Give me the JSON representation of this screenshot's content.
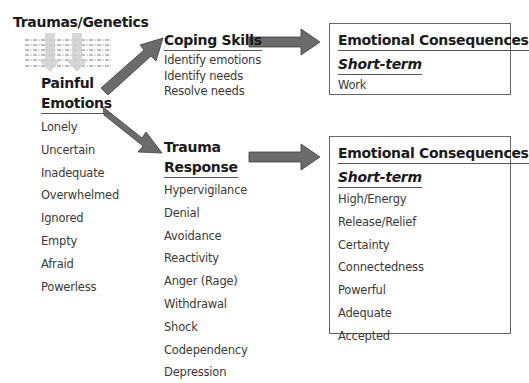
{
  "diagram": {
    "source": {
      "title": "Traumas/Genetics"
    },
    "painful_emotions": {
      "heading_line1": "Painful",
      "heading_line2": "Emotions",
      "items": [
        "Lonely",
        "Uncertain",
        "Inadequate",
        "Overwhelmed",
        "Ignored",
        "Empty",
        "Afraid",
        "Powerless"
      ]
    },
    "coping_skills": {
      "heading": "Coping Skills",
      "items": [
        "Identify emotions",
        "Identify needs",
        "Resolve needs"
      ]
    },
    "trauma_response": {
      "heading_line1": "Trauma",
      "heading_line2": "Response",
      "items": [
        "Hypervigilance",
        "Denial",
        "Avoidance",
        "Reactivity",
        "Anger (Rage)",
        "Withdrawal",
        "Shock",
        "Codependency",
        "Depression"
      ]
    },
    "consequences_coping": {
      "heading": "Emotional Consequences",
      "subheading": "Short-term",
      "items": [
        "Work"
      ]
    },
    "consequences_trauma": {
      "heading": "Emotional Consequences",
      "subheading": "Short-term",
      "items": [
        "High/Energy",
        "Release/Relief",
        "Certainty",
        "Connectedness",
        "Powerful",
        "Adequate",
        "Accepted"
      ]
    },
    "colors": {
      "arrow_fill": "#6b6b6b",
      "arrow_stroke": "#3d3d3d",
      "down_arrow_fill": "#cfcfcf",
      "box_border": "#666666",
      "text": "#333333"
    }
  }
}
